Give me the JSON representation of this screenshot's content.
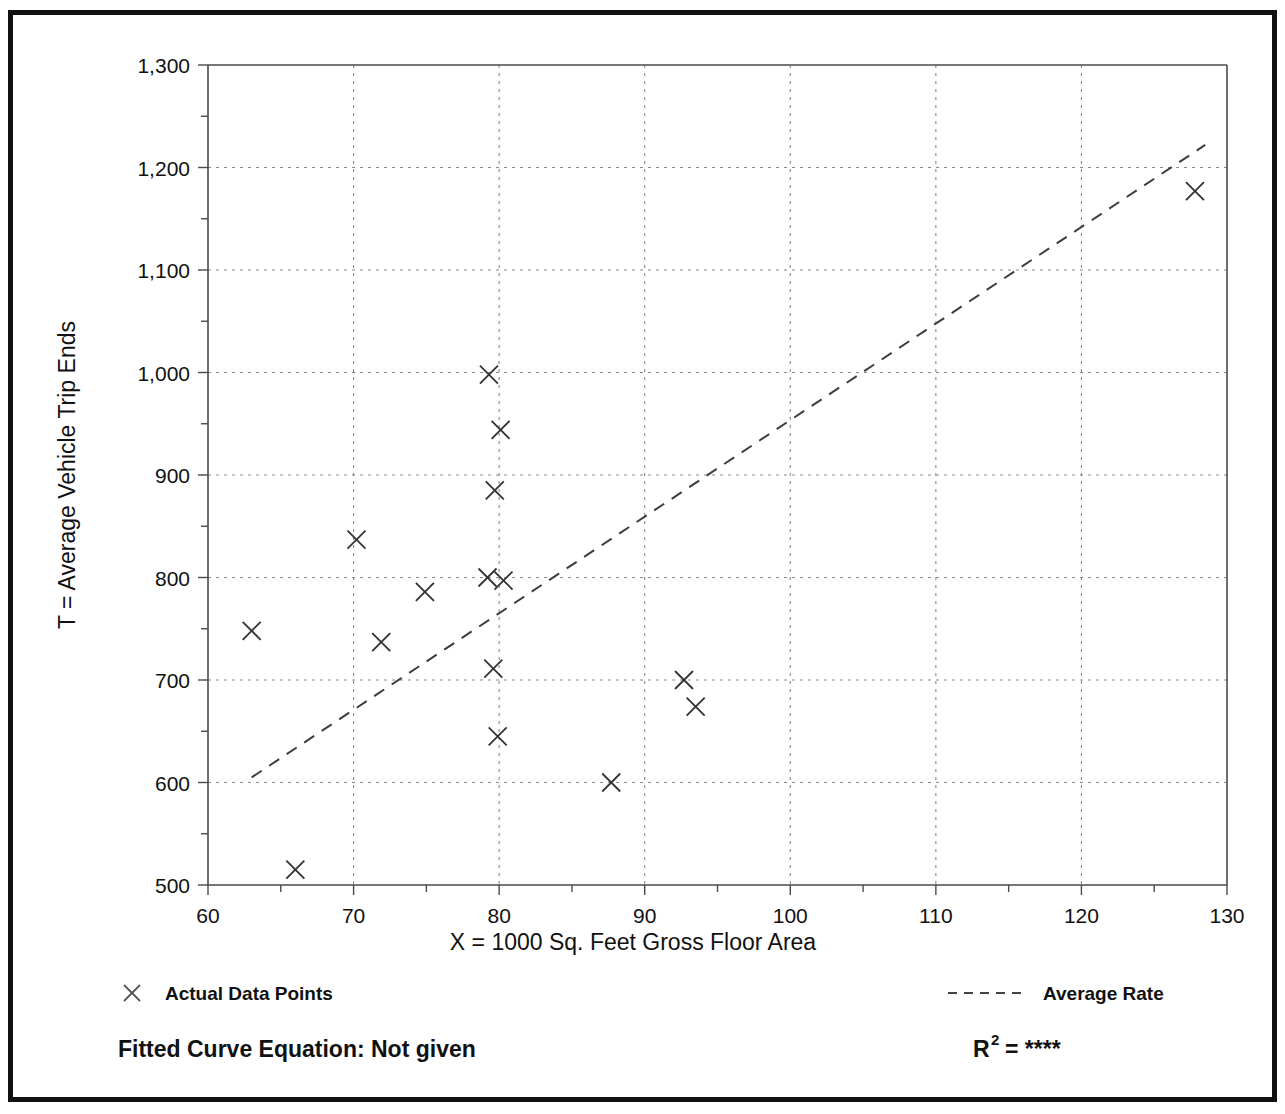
{
  "figure": {
    "border_color": "#111111",
    "background": "#ffffff"
  },
  "chart_data": {
    "type": "scatter",
    "title": "",
    "xlabel": "X = 1000 Sq. Feet Gross Floor Area",
    "ylabel": "T = Average Vehicle Trip Ends",
    "xlim": [
      60,
      130
    ],
    "ylim": [
      500,
      1300
    ],
    "xticks": [
      60,
      70,
      80,
      90,
      100,
      110,
      120,
      130
    ],
    "xtick_labels": [
      "60",
      "70",
      "80",
      "90",
      "100",
      "110",
      "120",
      "130"
    ],
    "xminor_step": 5,
    "yticks": [
      500,
      600,
      700,
      800,
      900,
      1000,
      1100,
      1200,
      1300
    ],
    "ytick_labels": [
      "500",
      "600",
      "700",
      "800",
      "900",
      "1,000",
      "1,100",
      "1,200",
      "1,300"
    ],
    "yminor_step": 50,
    "grid": true,
    "grid_style": "dashed",
    "marker": "x",
    "points": [
      {
        "x": 63.0,
        "y": 748
      },
      {
        "x": 66.0,
        "y": 515
      },
      {
        "x": 70.2,
        "y": 837
      },
      {
        "x": 71.9,
        "y": 737
      },
      {
        "x": 74.9,
        "y": 786
      },
      {
        "x": 79.3,
        "y": 998
      },
      {
        "x": 80.1,
        "y": 944
      },
      {
        "x": 79.7,
        "y": 885
      },
      {
        "x": 79.2,
        "y": 800
      },
      {
        "x": 80.3,
        "y": 797
      },
      {
        "x": 79.6,
        "y": 711
      },
      {
        "x": 79.9,
        "y": 645
      },
      {
        "x": 87.7,
        "y": 600
      },
      {
        "x": 92.7,
        "y": 700
      },
      {
        "x": 93.5,
        "y": 674
      },
      {
        "x": 127.8,
        "y": 1177
      }
    ],
    "trend_line": {
      "name": "Average Rate",
      "style": "dashed",
      "start": {
        "x": 63.0,
        "y": 605
      },
      "end": {
        "x": 128.5,
        "y": 1222
      }
    },
    "legend": [
      {
        "id": "actual-data-points",
        "label": "Actual Data Points",
        "symbol": "x-marker"
      },
      {
        "id": "average-rate",
        "label": "Average Rate",
        "symbol": "dashed-line"
      }
    ],
    "legend_position": "below-axis"
  },
  "footer": {
    "equation_label": "Fitted Curve Equation:  Not given",
    "r_squared_base": "R",
    "r_squared_exponent": "2",
    "r_squared_value": "= ****"
  }
}
